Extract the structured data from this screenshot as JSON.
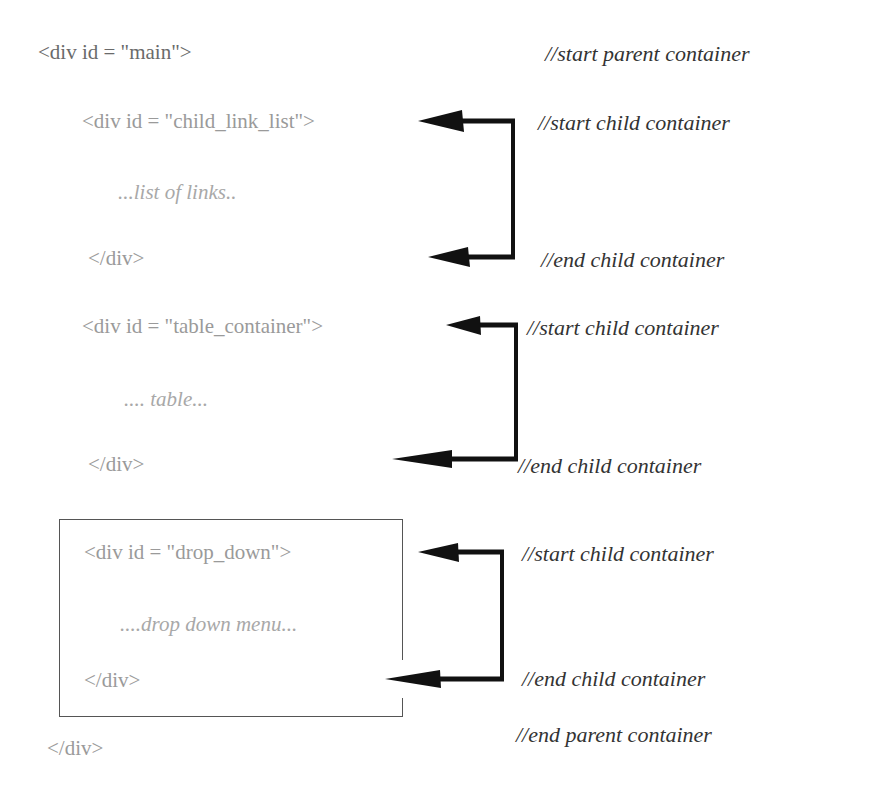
{
  "code": {
    "main_open": "<div id = \"main\">",
    "child_link_list_open": "<div id = \"child_link_list\">",
    "child_link_list_content": "...list of links..",
    "child_link_list_close": "</div>",
    "table_container_open": "<div id = \"table_container\">",
    "table_container_content": ".... table...",
    "table_container_close": "</div>",
    "drop_down_open": "<div id = \"drop_down\">",
    "drop_down_content": "....drop down menu...",
    "drop_down_close": "</div>",
    "main_close": "</div>"
  },
  "comments": {
    "start_parent": "//start parent container",
    "start_child_1": "//start child container",
    "end_child_1": "//end child container",
    "start_child_2": "//start child container",
    "end_child_2": "//end child container",
    "start_child_3": "//start child container",
    "end_child_3": "//end child container",
    "end_parent": "//end parent container"
  },
  "colors": {
    "arrow": "#111111",
    "box_border": "#555555"
  }
}
